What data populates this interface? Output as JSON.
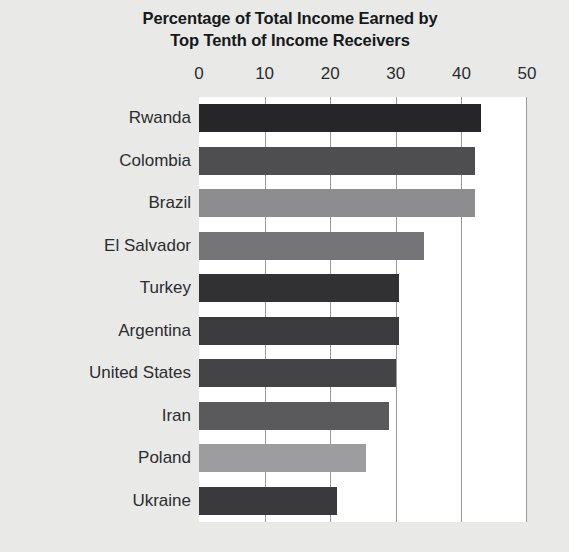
{
  "chart_data": {
    "type": "bar",
    "orientation": "horizontal",
    "title": "Percentage of Total Income Earned by Top Tenth of Income Receivers",
    "title_lines": [
      "Percentage of Total Income Earned by",
      "Top Tenth of Income Receivers"
    ],
    "xlabel": "",
    "ylabel": "",
    "xlim": [
      0,
      50
    ],
    "xticks": [
      0,
      10,
      20,
      30,
      40,
      50
    ],
    "xtick_labels": [
      "0",
      "10",
      "20",
      "30",
      "40",
      "50"
    ],
    "axis_position": "top",
    "grid": true,
    "grid_axis": "x",
    "legend": false,
    "categories": [
      "Rwanda",
      "Colombia",
      "Brazil",
      "El Salvador",
      "Turkey",
      "Argentina",
      "United States",
      "Iran",
      "Poland",
      "Ukraine"
    ],
    "values": [
      43,
      42,
      42,
      34.3,
      30.5,
      30.5,
      30,
      29,
      25.5,
      21
    ],
    "bar_colors": [
      "#262628",
      "#4e4e50",
      "#8d8d8f",
      "#757577",
      "#313133",
      "#3c3c3e",
      "#444446",
      "#5a5a5c",
      "#9d9d9f",
      "#3a3a3c"
    ],
    "background_color": "#e9e9e7",
    "plot_background_color": "#ffffff",
    "gridline_color": "#9a9a9a",
    "text_color": "#2b2d2f"
  }
}
